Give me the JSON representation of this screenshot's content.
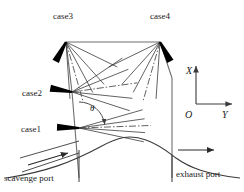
{
  "diagram": {
    "colors": {
      "stroke": "#3a3a3a",
      "wall": "#6e6e6e",
      "nozzle": "#000000",
      "text": "#1a1a1a",
      "background": "#ffffff"
    },
    "labels": {
      "case1": "case1",
      "case2": "case2",
      "case3": "case3",
      "case4": "case4",
      "theta": "θ",
      "axis_x": "X",
      "axis_y": "Y",
      "origin": "O",
      "scavenge_port": "scavenge port",
      "exhaust_port": "exhaust port"
    },
    "injectors": [
      {
        "name": "case1",
        "tip": [
          79,
          128
        ],
        "nozzle_angle_deg": 2,
        "nozzle_length": 22,
        "label_pos": [
          21,
          125
        ],
        "spray_ray_angles_deg": [
          -16,
          -8,
          -2,
          4,
          12
        ],
        "spray_ray_length": 72,
        "center_ray_index": 2
      },
      {
        "name": "case2",
        "tip": [
          72,
          92
        ],
        "nozzle_angle_deg": 10,
        "nozzle_length": 22,
        "label_pos": [
          22,
          89
        ],
        "spray_ray_angles_deg": [
          -34,
          -22,
          -8,
          6,
          18
        ],
        "spray_ray_length": 66,
        "center_ray_index": 2
      },
      {
        "name": "case3",
        "tip": [
          66,
          42
        ],
        "nozzle_angle_deg": -62,
        "nozzle_length": 22,
        "label_pos": [
          53,
          12
        ],
        "spray_ray_angles_deg": [
          48,
          62,
          74,
          86,
          26
        ],
        "spray_ray_length": 62,
        "center_ray_index": 2
      },
      {
        "name": "case4",
        "tip": [
          160,
          42
        ],
        "nozzle_angle_deg": -118,
        "nozzle_length": 22,
        "label_pos": [
          150,
          12
        ],
        "spray_ray_angles_deg": [
          132,
          118,
          106,
          94,
          154
        ],
        "spray_ray_length": 62,
        "center_ray_index": 2
      }
    ],
    "axes": {
      "origin": [
        196,
        104
      ],
      "x_tip": [
        196,
        66
      ],
      "y_tip": [
        232,
        104
      ],
      "x_label_pos": [
        186,
        66
      ],
      "y_label_pos": [
        222,
        110
      ],
      "origin_label_pos": [
        185,
        110
      ]
    },
    "theta_arc": {
      "vertex": [
        79,
        128
      ],
      "radius": 26,
      "from_deg": -90,
      "to_deg": -8,
      "label_pos": [
        90,
        104
      ]
    },
    "flow_arrows": [
      {
        "name": "scavenge-flow-arrow",
        "from": [
          28,
          165
        ],
        "to": [
          68,
          153
        ]
      },
      {
        "name": "exhaust-flow-arrow",
        "from": [
          178,
          150
        ],
        "to": [
          214,
          150
        ]
      }
    ],
    "port_labels": {
      "scavenge_pos": [
        4,
        174
      ],
      "exhaust_pos": [
        176,
        170
      ]
    }
  }
}
